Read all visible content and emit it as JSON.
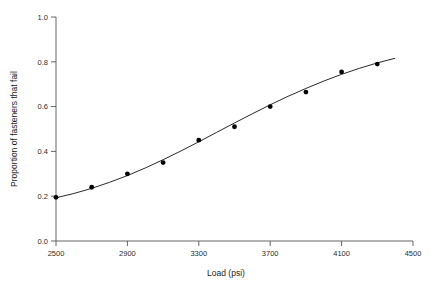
{
  "chart_data": {
    "type": "scatter",
    "title": "",
    "subtitle": "",
    "xlabel": "Load (psi)",
    "ylabel": "Proportion of fasteners that fail",
    "xlim": [
      2500,
      4500
    ],
    "ylim": [
      0.0,
      1.0
    ],
    "xticks": [
      2500,
      2900,
      3300,
      3700,
      4100,
      4500
    ],
    "xtick_labels": [
      "2500",
      "2900",
      "3300",
      "3700",
      "4100",
      "4500"
    ],
    "yticks": [
      0.0,
      0.2,
      0.4,
      0.6,
      0.8,
      1.0
    ],
    "ytick_labels": [
      "0.0",
      "0.2",
      "0.4",
      "0.6",
      "0.8",
      "1.0"
    ],
    "grid": false,
    "legend": null,
    "series": [
      {
        "name": "Observed proportion failing",
        "marker": "filled-circle",
        "color": "#000000",
        "x": [
          2500,
          2700,
          2900,
          3100,
          3300,
          3500,
          3700,
          3900,
          4100,
          4300
        ],
        "y": [
          0.195,
          0.24,
          0.3,
          0.35,
          0.45,
          0.51,
          0.6,
          0.665,
          0.755,
          0.79
        ]
      },
      {
        "name": "Fitted logistic curve",
        "marker": "none",
        "color": "#111111",
        "x": [
          2500,
          2600,
          2700,
          2800,
          2900,
          3000,
          3100,
          3200,
          3300,
          3400,
          3500,
          3600,
          3700,
          3800,
          3900,
          4000,
          4100,
          4200,
          4300,
          4400
        ],
        "y": [
          0.193,
          0.212,
          0.235,
          0.262,
          0.292,
          0.326,
          0.363,
          0.402,
          0.443,
          0.485,
          0.527,
          0.568,
          0.608,
          0.646,
          0.681,
          0.714,
          0.744,
          0.771,
          0.795,
          0.816
        ]
      }
    ]
  },
  "axes": {
    "x_axis_name": "load-axis",
    "y_axis_name": "proportion-axis"
  }
}
